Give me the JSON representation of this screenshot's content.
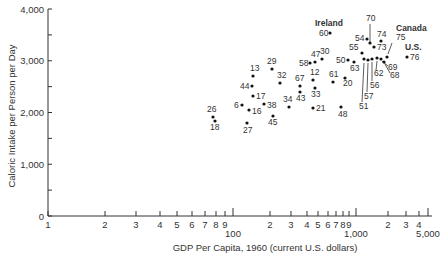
{
  "chart_data": {
    "type": "scatter",
    "title": "",
    "xlabel": "GDP Per Capita, 1960 (current U.S. dollars)",
    "ylabel": "Caloric Intake per Person per Day",
    "xscale": "log",
    "ylim": [
      0,
      4000
    ],
    "grid": false,
    "y_ticks": [
      {
        "value": 0,
        "label": "0"
      },
      {
        "value": 500,
        "label": ""
      },
      {
        "value": 1000,
        "label": "1,000"
      },
      {
        "value": 1500,
        "label": ""
      },
      {
        "value": 2000,
        "label": "2,000"
      },
      {
        "value": 2500,
        "label": ""
      },
      {
        "value": 3000,
        "label": "3,000"
      },
      {
        "value": 3500,
        "label": ""
      },
      {
        "value": 4000,
        "label": "4,000"
      }
    ],
    "x_ticks": [
      {
        "px": 48,
        "label": "1"
      },
      {
        "px": 105,
        "label": "2"
      },
      {
        "px": 136,
        "label": "3"
      },
      {
        "px": 160,
        "label": "4"
      },
      {
        "px": 177,
        "label": "5"
      },
      {
        "px": 192,
        "label": "6"
      },
      {
        "px": 205,
        "label": "7"
      },
      {
        "px": 216,
        "label": "8"
      },
      {
        "px": 225,
        "label": "9"
      },
      {
        "px": 233,
        "label": "100",
        "major": true
      },
      {
        "px": 270,
        "label": "2"
      },
      {
        "px": 291,
        "label": "3"
      },
      {
        "px": 307,
        "label": "4"
      },
      {
        "px": 318,
        "label": "5"
      },
      {
        "px": 328,
        "label": "6"
      },
      {
        "px": 336,
        "label": "7"
      },
      {
        "px": 343,
        "label": "8"
      },
      {
        "px": 349,
        "label": "9"
      },
      {
        "px": 356,
        "label": "1,000",
        "major": true
      },
      {
        "px": 388,
        "label": "2"
      },
      {
        "px": 406,
        "label": "3"
      },
      {
        "px": 419,
        "label": "4"
      },
      {
        "px": 428,
        "label": "5,000",
        "major": true
      }
    ],
    "points": [
      {
        "id": "26",
        "gdp": 78,
        "cal": 1920,
        "px": 213,
        "py": 117,
        "lx": 207,
        "ly": 112
      },
      {
        "id": "18",
        "gdp": 80,
        "cal": 1860,
        "px": 215,
        "py": 121,
        "lx": 210,
        "ly": 130
      },
      {
        "id": "6",
        "gdp": 118,
        "cal": 2150,
        "px": 242,
        "py": 105,
        "lx": 234,
        "ly": 108
      },
      {
        "id": "16",
        "gdp": 135,
        "cal": 2060,
        "px": 249,
        "py": 110,
        "lx": 252,
        "ly": 114
      },
      {
        "id": "27",
        "gdp": 130,
        "cal": 1800,
        "px": 247,
        "py": 123,
        "lx": 243,
        "ly": 133
      },
      {
        "id": "38",
        "gdp": 179,
        "cal": 2170,
        "px": 264,
        "py": 104,
        "lx": 267,
        "ly": 108
      },
      {
        "id": "45",
        "gdp": 211,
        "cal": 1940,
        "px": 273,
        "py": 116,
        "lx": 268,
        "ly": 125
      },
      {
        "id": "17",
        "gdp": 145,
        "cal": 2330,
        "px": 253,
        "py": 96,
        "lx": 256,
        "ly": 99
      },
      {
        "id": "44",
        "gdp": 143,
        "cal": 2520,
        "px": 252,
        "py": 86,
        "lx": 240,
        "ly": 89
      },
      {
        "id": "13",
        "gdp": 145,
        "cal": 2720,
        "px": 253,
        "py": 76,
        "lx": 250,
        "ly": 71
      },
      {
        "id": "29",
        "gdp": 207,
        "cal": 2850,
        "px": 272,
        "py": 69,
        "lx": 267,
        "ly": 64
      },
      {
        "id": "32",
        "gdp": 241,
        "cal": 2580,
        "px": 280,
        "py": 83,
        "lx": 277,
        "ly": 78
      },
      {
        "id": "34",
        "gdp": 285,
        "cal": 2120,
        "px": 289,
        "py": 107,
        "lx": 283,
        "ly": 102
      },
      {
        "id": "67",
        "gdp": 350,
        "cal": 2520,
        "px": 300,
        "py": 86,
        "lx": 295,
        "ly": 81
      },
      {
        "id": "43",
        "gdp": 350,
        "cal": 2410,
        "px": 300,
        "py": 92,
        "lx": 296,
        "ly": 101
      },
      {
        "id": "58",
        "gdp": 423,
        "cal": 2970,
        "px": 310,
        "py": 63,
        "lx": 299,
        "ly": 66
      },
      {
        "id": "47",
        "gdp": 464,
        "cal": 2990,
        "px": 315,
        "py": 62,
        "lx": 311,
        "ly": 57
      },
      {
        "id": "30",
        "gdp": 530,
        "cal": 3050,
        "px": 322,
        "py": 59,
        "lx": 320,
        "ly": 54
      },
      {
        "id": "12",
        "gdp": 447,
        "cal": 2640,
        "px": 313,
        "py": 80,
        "lx": 310,
        "ly": 75
      },
      {
        "id": "33",
        "gdp": 464,
        "cal": 2490,
        "px": 315,
        "py": 88,
        "lx": 311,
        "ly": 97
      },
      {
        "id": "21",
        "gdp": 447,
        "cal": 2100,
        "px": 313,
        "py": 108,
        "lx": 316,
        "ly": 111
      },
      {
        "id": "61",
        "gdp": 650,
        "cal": 2600,
        "px": 333,
        "py": 82,
        "lx": 329,
        "ly": 77
      },
      {
        "id": "20",
        "gdp": 815,
        "cal": 2680,
        "px": 345,
        "py": 78,
        "lx": 343,
        "ly": 86
      },
      {
        "id": "48",
        "gdp": 754,
        "cal": 2120,
        "px": 341,
        "py": 107,
        "lx": 338,
        "ly": 117
      },
      {
        "id": "60",
        "gdp": 614,
        "cal": 3550,
        "px": 330,
        "py": 33,
        "lx": 319,
        "ly": 36,
        "country": "Ireland"
      },
      {
        "id": "50",
        "gdp": 860,
        "cal": 3030,
        "px": 348,
        "py": 60,
        "lx": 336,
        "ly": 63
      },
      {
        "id": "63",
        "gdp": 960,
        "cal": 2990,
        "px": 354,
        "py": 62,
        "lx": 350,
        "ly": 71
      },
      {
        "id": "55",
        "gdp": 1120,
        "cal": 3170,
        "px": 362,
        "py": 53,
        "lx": 349,
        "ly": 50
      },
      {
        "id": "54",
        "gdp": 1230,
        "cal": 3440,
        "px": 367,
        "py": 39,
        "lx": 355,
        "ly": 41
      },
      {
        "id": "70",
        "gdp": 1300,
        "cal": 3360,
        "px": 370,
        "py": 43,
        "lx": 366,
        "ly": 21
      },
      {
        "id": "74",
        "gdp": 1600,
        "cal": 3400,
        "px": 381,
        "py": 41,
        "lx": 377,
        "ly": 37
      },
      {
        "id": "73",
        "gdp": 1400,
        "cal": 3280,
        "px": 374,
        "py": 47,
        "lx": 377,
        "ly": 50
      },
      {
        "id": "51",
        "gdp": 1140,
        "cal": 2890,
        "px": 364,
        "py": 59,
        "lx": 359,
        "ly": 109
      },
      {
        "id": "57",
        "gdp": 1250,
        "cal": 3050,
        "px": 368,
        "py": 60,
        "lx": 364,
        "ly": 99
      },
      {
        "id": "56",
        "gdp": 1350,
        "cal": 3050,
        "px": 372,
        "py": 59,
        "lx": 370,
        "ly": 88
      },
      {
        "id": "62",
        "gdp": 1480,
        "cal": 3070,
        "px": 377,
        "py": 58,
        "lx": 374,
        "ly": 76
      },
      {
        "id": "69",
        "gdp": 1600,
        "cal": 3050,
        "px": 381,
        "py": 59,
        "lx": 388,
        "ly": 70
      },
      {
        "id": "68",
        "gdp": 1690,
        "cal": 2990,
        "px": 384,
        "py": 62,
        "lx": 390,
        "ly": 78
      },
      {
        "id": "75",
        "gdp": 1790,
        "cal": 3070,
        "px": 387,
        "py": 57,
        "lx": 396,
        "ly": 40,
        "country": "Canada"
      },
      {
        "id": "76",
        "gdp": 2600,
        "cal": 3090,
        "px": 407,
        "py": 57,
        "lx": 410,
        "ly": 60,
        "country": "U.S."
      }
    ],
    "annotations": [
      {
        "text": "Ireland",
        "x": 315,
        "y": 26
      },
      {
        "text": "Canada",
        "x": 396,
        "y": 31
      },
      {
        "text": "U.S.",
        "x": 405,
        "y": 50
      }
    ]
  }
}
